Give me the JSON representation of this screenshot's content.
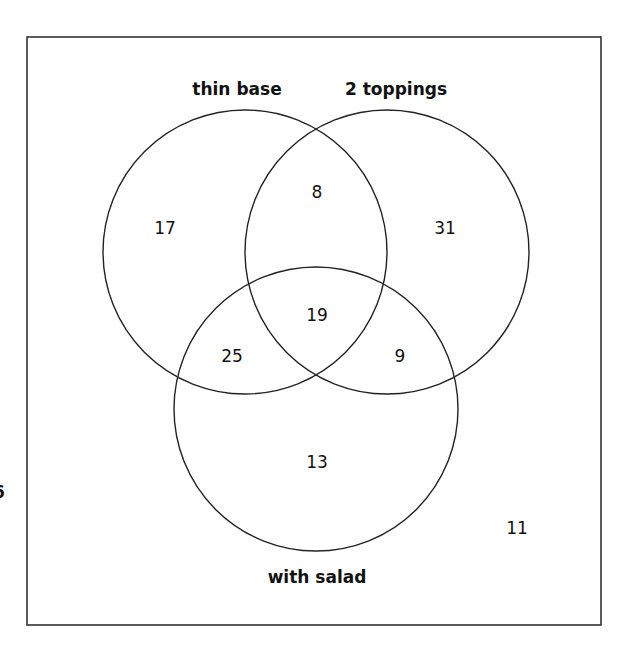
{
  "diagram": {
    "type": "venn",
    "sets": [
      {
        "id": "A",
        "label": "thin base"
      },
      {
        "id": "B",
        "label": "2 toppings"
      },
      {
        "id": "C",
        "label": "with salad"
      }
    ],
    "regions": {
      "only_thin_base": "17",
      "only_2_toppings": "31",
      "only_with_salad": "13",
      "thin_base_and_2_toppings_only": "8",
      "thin_base_and_with_salad_only": "25",
      "2_toppings_and_with_salad_only": "9",
      "all_three": "19",
      "none": "11"
    },
    "clipped_left_glyph": "6",
    "colors": {
      "stroke": "#222222",
      "frame": "#333333",
      "text": "#111111",
      "background": "#ffffff"
    }
  }
}
